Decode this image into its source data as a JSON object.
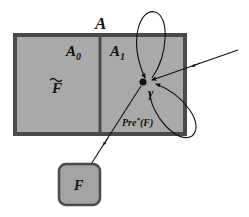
{
  "diagram": {
    "title": "A",
    "regions": [
      {
        "id": "A0",
        "label": "A",
        "subscript": "0",
        "inner_label": "F",
        "inner_label_decoration": "tilde"
      },
      {
        "id": "A1",
        "label": "A",
        "subscript": "1"
      }
    ],
    "state": {
      "label": "γ"
    },
    "edge_label": {
      "main": "Pre",
      "sup": "*",
      "arg": "(F)"
    },
    "target": {
      "label": "F"
    },
    "colors": {
      "region_fill": "#a9a9a9",
      "border": "#4a4a4a",
      "target_fill": "#a3a3a3",
      "ink": "#111111",
      "background": "#ffffff"
    },
    "edges": [
      {
        "from": "external",
        "to": "γ",
        "type": "incoming-arrow"
      },
      {
        "from": "γ",
        "to": "γ",
        "type": "self-loop-top"
      },
      {
        "from": "γ",
        "to": "γ",
        "type": "self-loop-bottom-right"
      },
      {
        "from": "γ",
        "to": "F",
        "type": "arrow",
        "label": "Pre*(F)"
      }
    ]
  }
}
